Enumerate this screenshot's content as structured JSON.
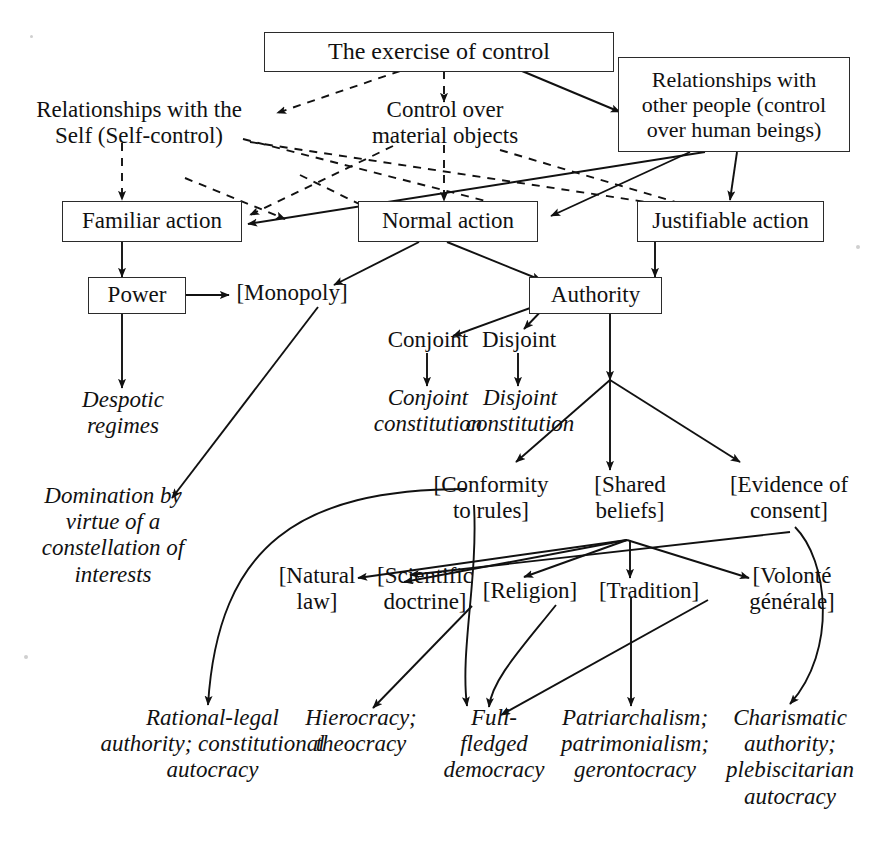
{
  "diagram": {
    "title": "The exercise of control",
    "type": "hierarchical flow diagram",
    "nodes": {
      "exercise_of_control": "The exercise of control",
      "relationships_self": "Relationships with the\nSelf (Self-control)",
      "control_material": "Control over\nmaterial objects",
      "relationships_other": "Relationships with\nother people (control\nover human beings)",
      "familiar_action": "Familiar action",
      "normal_action": "Normal action",
      "justifiable_action": "Justifiable action",
      "power": "Power",
      "monopoly": "[Monopoly]",
      "authority": "Authority",
      "conjoint": "Conjoint",
      "disjoint": "Disjoint",
      "conjoint_constitution": "Conjoint\nconstitution",
      "disjoint_constitution": "Disjoint\nconstitution",
      "despotic_regimes": "Despotic\nregimes",
      "domination": "Domination by\nvirtue of a\nconstellation of\ninterests",
      "conformity_to_rules": "[Conformity\nto rules]",
      "shared_beliefs": "[Shared\nbeliefs]",
      "evidence_of_consent": "[Evidence of\nconsent]",
      "natural_law": "[Natural\nlaw]",
      "scientific_doctrine": "[Scientific\ndoctrine]",
      "religion": "[Religion]",
      "tradition": "[Tradition]",
      "volonte_generale": "[Volonté\ngénérale]",
      "rational_legal": "Rational-legal\nauthority; constitutional\nautocracy",
      "hierocracy": "Hierocracy;\ntheocracy",
      "full_fledged_democracy": "Full-\nfledged\ndemocracy",
      "patriarchalism": "Patriarchalism;\npatrimonialism;\ngerontocracy",
      "charismatic": "Charismatic\nauthority;\nplebiscitarian\nautocracy"
    },
    "lines": {
      "exercise_of_control_l1": "The exercise of control",
      "relationships_self_l1": "Relationships with the",
      "relationships_self_l2": "Self (Self-control)",
      "control_material_l1": "Control over",
      "control_material_l2": "material objects",
      "relationships_other_l1": "Relationships with",
      "relationships_other_l2": "other people (control",
      "relationships_other_l3": "over human beings)",
      "familiar_action_l1": "Familiar action",
      "normal_action_l1": "Normal action",
      "justifiable_action_l1": "Justifiable action",
      "power_l1": "Power",
      "monopoly_l1": "[Monopoly]",
      "authority_l1": "Authority",
      "conjoint_l1": "Conjoint",
      "disjoint_l1": "Disjoint",
      "conjoint_constitution_l1": "Conjoint",
      "conjoint_constitution_l2": "constitution",
      "disjoint_constitution_l1": "Disjoint",
      "disjoint_constitution_l2": "constitution",
      "despotic_l1": "Despotic",
      "despotic_l2": "regimes",
      "domination_l1": "Domination by",
      "domination_l2": "virtue of a",
      "domination_l3": "constellation of",
      "domination_l4": "interests",
      "conformity_l1": "[Conformity",
      "conformity_l2": "to rules]",
      "shared_l1": "[Shared",
      "shared_l2": "beliefs]",
      "evidence_l1": "[Evidence of",
      "evidence_l2": "consent]",
      "natural_l1": "[Natural",
      "natural_l2": "law]",
      "scientific_l1": "[Scientific",
      "scientific_l2": "doctrine]",
      "religion_l1": "[Religion]",
      "tradition_l1": "[Tradition]",
      "volonte_l1": "[Volonté",
      "volonte_l2": "générale]",
      "rational_l1": "Rational-legal",
      "rational_l2": "authority; constitutional",
      "rational_l3": "autocracy",
      "hierocracy_l1": "Hierocracy;",
      "hierocracy_l2": "theocracy",
      "full_l1": "Full-",
      "full_l2": "fledged",
      "full_l3": "democracy",
      "patriarchalism_l1": "Patriarchalism;",
      "patriarchalism_l2": "patrimonialism;",
      "patriarchalism_l3": "gerontocracy",
      "charismatic_l1": "Charismatic",
      "charismatic_l2": "authority;",
      "charismatic_l3": "plebiscitarian",
      "charismatic_l4": "autocracy"
    },
    "edges": [
      {
        "from": "exercise_of_control",
        "to": "relationships_self",
        "style": "dashed"
      },
      {
        "from": "exercise_of_control",
        "to": "control_material",
        "style": "dashed"
      },
      {
        "from": "exercise_of_control",
        "to": "relationships_other",
        "style": "solid"
      },
      {
        "from": "relationships_self",
        "to": "familiar_action",
        "style": "dashed"
      },
      {
        "from": "relationships_self",
        "to": "normal_action",
        "style": "dashed"
      },
      {
        "from": "relationships_self",
        "to": "justifiable_action",
        "style": "dashed"
      },
      {
        "from": "control_material",
        "to": "normal_action",
        "style": "dashed"
      },
      {
        "from": "control_material",
        "to": "familiar_action",
        "style": "dashed"
      },
      {
        "from": "control_material",
        "to": "justifiable_action",
        "style": "dashed"
      },
      {
        "from": "relationships_other",
        "to": "familiar_action",
        "style": "solid"
      },
      {
        "from": "relationships_other",
        "to": "normal_action",
        "style": "solid"
      },
      {
        "from": "relationships_other",
        "to": "justifiable_action",
        "style": "solid"
      },
      {
        "from": "familiar_action",
        "to": "power",
        "style": "solid"
      },
      {
        "from": "power",
        "to": "monopoly",
        "style": "solid"
      },
      {
        "from": "power",
        "to": "despotic_regimes",
        "style": "solid"
      },
      {
        "from": "normal_action",
        "to": "monopoly",
        "style": "solid"
      },
      {
        "from": "normal_action",
        "to": "authority",
        "style": "solid"
      },
      {
        "from": "justifiable_action",
        "to": "authority",
        "style": "solid"
      },
      {
        "from": "authority",
        "to": "conjoint",
        "style": "solid"
      },
      {
        "from": "authority",
        "to": "disjoint",
        "style": "solid"
      },
      {
        "from": "conjoint",
        "to": "conjoint_constitution",
        "style": "solid"
      },
      {
        "from": "disjoint",
        "to": "disjoint_constitution",
        "style": "solid"
      },
      {
        "from": "monopoly",
        "to": "domination",
        "style": "solid"
      },
      {
        "from": "authority",
        "to": "conformity_to_rules",
        "style": "solid"
      },
      {
        "from": "authority",
        "to": "shared_beliefs",
        "style": "solid"
      },
      {
        "from": "authority",
        "to": "evidence_of_consent",
        "style": "solid"
      },
      {
        "from": "shared_beliefs",
        "to": "natural_law",
        "style": "solid"
      },
      {
        "from": "shared_beliefs",
        "to": "scientific_doctrine",
        "style": "solid"
      },
      {
        "from": "shared_beliefs",
        "to": "religion",
        "style": "solid"
      },
      {
        "from": "shared_beliefs",
        "to": "tradition",
        "style": "solid"
      },
      {
        "from": "shared_beliefs",
        "to": "volonte_generale",
        "style": "solid"
      },
      {
        "from": "conformity_to_rules",
        "to": "rational_legal",
        "style": "solid-curve"
      },
      {
        "from": "conformity_to_rules",
        "to": "full_fledged_democracy",
        "style": "solid-curve"
      },
      {
        "from": "scientific_doctrine",
        "to": "hierocracy",
        "style": "solid"
      },
      {
        "from": "religion",
        "to": "full_fledged_democracy",
        "style": "solid-curve"
      },
      {
        "from": "tradition",
        "to": "patriarchalism",
        "style": "solid"
      },
      {
        "from": "volonte_generale",
        "to": "full_fledged_democracy",
        "style": "solid"
      },
      {
        "from": "evidence_of_consent",
        "to": "charismatic",
        "style": "solid-curve"
      }
    ]
  }
}
